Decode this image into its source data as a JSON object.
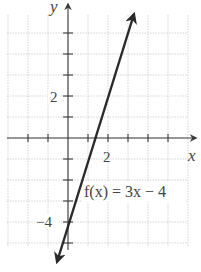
{
  "chart_data": {
    "type": "line",
    "title": "",
    "xlabel": "x",
    "ylabel": "y",
    "function_label": "f(x) = 3x − 4",
    "equation": {
      "slope": 3,
      "intercept": -4
    },
    "series": [
      {
        "name": "f(x) = 3x − 4",
        "x": [
          -0.6,
          0,
          1.333,
          2,
          3.3
        ],
        "y": [
          -5.8,
          -4,
          0,
          2,
          5.9
        ]
      }
    ],
    "labeled_ticks": {
      "x": [
        2
      ],
      "y": [
        2,
        -4
      ]
    },
    "tick_labels": {
      "x": [
        "2"
      ],
      "y": [
        "2",
        "−4"
      ]
    },
    "xlim": [
      -3.0,
      6.0
    ],
    "ylim": [
      -6.0,
      6.0
    ],
    "grid": true,
    "tick_step": 1,
    "arrows_on_line_ends": true,
    "colors": {
      "line": "#2a2a2a",
      "axis": "#3a3a3a",
      "grid": "#c8c8c8",
      "background": "#ffffff"
    }
  },
  "labels": {
    "x_axis": "x",
    "y_axis": "y",
    "x_tick_2": "2",
    "y_tick_2": "2",
    "y_tick_neg4": "−4",
    "function": "f(x) = 3x − 4"
  }
}
